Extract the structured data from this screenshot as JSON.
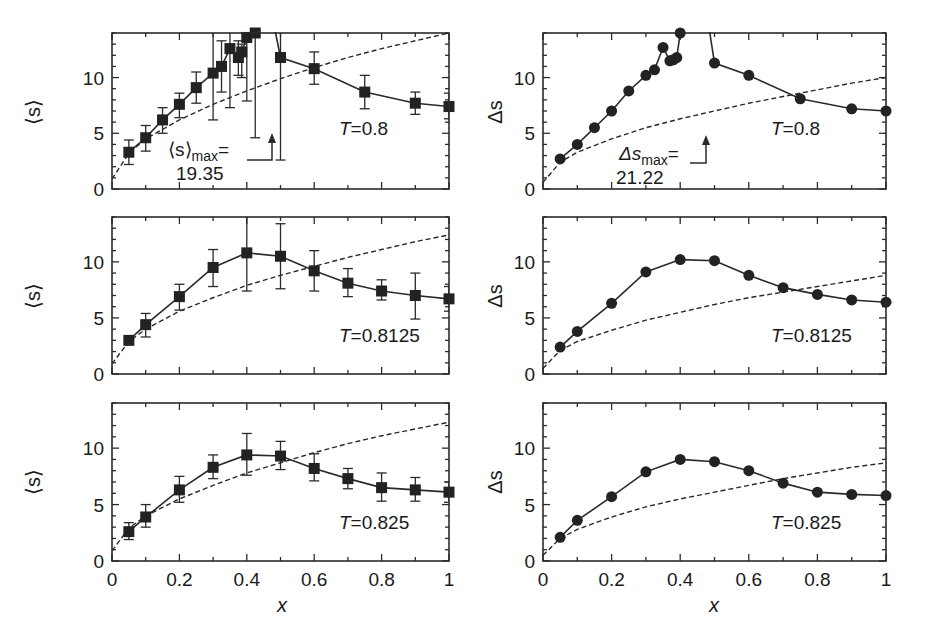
{
  "figure": {
    "x_axis_label": "x",
    "x_tick_labels": [
      "0",
      "0.2",
      "0.4",
      "0.6",
      "0.8",
      "1"
    ],
    "y_tick_labels": [
      "0",
      "5",
      "10"
    ],
    "left_ylabel": "⟨s⟩",
    "right_ylabel": "Δs"
  },
  "annotations": {
    "mean_max_label": "⟨s⟩",
    "mean_max_sub": "max",
    "mean_max_eq": "=",
    "mean_max_value": "19.35",
    "delta_max_label": "Δs",
    "delta_max_sub": "max",
    "delta_max_eq": "=",
    "delta_max_value": "21.22"
  },
  "chart_data": [
    {
      "type": "line",
      "panel": "top-left",
      "title": "T=0.8",
      "xlabel": "",
      "ylabel": "⟨s⟩",
      "xlim": [
        0,
        1
      ],
      "ylim": [
        0,
        14
      ],
      "grid": false,
      "marker": "square",
      "series": [
        {
          "name": "⟨s⟩ data",
          "x": [
            0.05,
            0.1,
            0.15,
            0.2,
            0.25,
            0.3,
            0.325,
            0.35,
            0.375,
            0.385,
            0.4,
            0.425,
            0.45,
            0.5,
            0.6,
            0.75,
            0.9,
            1.0
          ],
          "y": [
            3.3,
            4.6,
            6.2,
            7.6,
            9.1,
            10.4,
            11.0,
            12.6,
            11.8,
            12.3,
            13.6,
            14.0,
            19.35,
            11.8,
            10.8,
            8.7,
            7.7,
            7.4
          ],
          "err_low": [
            2.2,
            3.4,
            5.0,
            6.4,
            7.7,
            6.2,
            8.7,
            7.3,
            10.2,
            10.0,
            7.9,
            4.6,
            14.0,
            2.6,
            9.4,
            7.2,
            6.7,
            6.3
          ],
          "err_high": [
            4.4,
            5.7,
            7.3,
            8.6,
            10.5,
            14.0,
            13.3,
            14.0,
            13.3,
            13.0,
            14.0,
            14.0,
            19.35,
            14.0,
            12.3,
            10.2,
            8.7,
            8.6
          ]
        },
        {
          "name": "fit (dashed)",
          "x": [
            0,
            0.05,
            0.1,
            0.2,
            0.3,
            0.4,
            0.5,
            0.6,
            0.7,
            0.8,
            0.9,
            1.0
          ],
          "y": [
            0.9,
            3.2,
            4.5,
            6.2,
            7.6,
            8.8,
            9.9,
            10.9,
            11.8,
            12.6,
            13.3,
            14.0
          ]
        }
      ],
      "annotation": "⟨s⟩max = 19.35 (off-scale peak, arrow at x≈0.45)"
    },
    {
      "type": "line",
      "panel": "top-right",
      "title": "T=0.8",
      "xlabel": "",
      "ylabel": "Δs",
      "xlim": [
        0,
        1
      ],
      "ylim": [
        0,
        14
      ],
      "grid": false,
      "marker": "circle",
      "series": [
        {
          "name": "Δs data",
          "x": [
            0.05,
            0.1,
            0.15,
            0.2,
            0.25,
            0.3,
            0.325,
            0.35,
            0.37,
            0.38,
            0.39,
            0.4,
            0.45,
            0.5,
            0.6,
            0.75,
            0.9,
            1.0
          ],
          "y": [
            2.7,
            4.0,
            5.5,
            7.0,
            8.8,
            10.2,
            10.7,
            12.7,
            11.5,
            11.6,
            11.8,
            14.0,
            21.22,
            11.3,
            10.2,
            8.1,
            7.2,
            7.0
          ]
        },
        {
          "name": "fit (dashed)",
          "x": [
            0,
            0.05,
            0.1,
            0.2,
            0.3,
            0.4,
            0.5,
            0.6,
            0.7,
            0.8,
            0.9,
            1.0
          ],
          "y": [
            0.6,
            2.4,
            3.3,
            4.5,
            5.5,
            6.3,
            7.0,
            7.7,
            8.3,
            8.9,
            9.5,
            10.0
          ]
        }
      ],
      "annotation": "Δsmax = 21.22 (off-scale peak, arrow at x≈0.45)"
    },
    {
      "type": "line",
      "panel": "middle-left",
      "title": "T=0.8125",
      "xlabel": "",
      "ylabel": "⟨s⟩",
      "xlim": [
        0,
        1
      ],
      "ylim": [
        0,
        14
      ],
      "grid": false,
      "marker": "square",
      "series": [
        {
          "name": "⟨s⟩ data",
          "x": [
            0.05,
            0.1,
            0.2,
            0.3,
            0.4,
            0.5,
            0.6,
            0.7,
            0.8,
            0.9,
            1.0
          ],
          "y": [
            3.0,
            4.4,
            6.9,
            9.5,
            10.8,
            10.5,
            9.2,
            8.1,
            7.4,
            7.0,
            6.7
          ],
          "err_low": [
            2.9,
            3.3,
            5.7,
            7.8,
            7.4,
            7.6,
            7.4,
            6.9,
            6.6,
            4.9,
            5.6
          ],
          "err_high": [
            3.1,
            5.4,
            8.0,
            11.1,
            14.0,
            13.4,
            11.0,
            9.4,
            8.4,
            9.0,
            7.8
          ]
        },
        {
          "name": "fit (dashed)",
          "x": [
            0,
            0.05,
            0.1,
            0.2,
            0.3,
            0.4,
            0.5,
            0.6,
            0.7,
            0.8,
            0.9,
            1.0
          ],
          "y": [
            0.9,
            2.9,
            4.0,
            5.6,
            6.8,
            7.9,
            8.8,
            9.6,
            10.4,
            11.1,
            11.8,
            12.4
          ]
        }
      ]
    },
    {
      "type": "line",
      "panel": "middle-right",
      "title": "T=0.8125",
      "xlabel": "",
      "ylabel": "Δs",
      "xlim": [
        0,
        1
      ],
      "ylim": [
        0,
        14
      ],
      "grid": false,
      "marker": "circle",
      "series": [
        {
          "name": "Δs data",
          "x": [
            0.05,
            0.1,
            0.2,
            0.3,
            0.4,
            0.5,
            0.6,
            0.7,
            0.8,
            0.9,
            1.0
          ],
          "y": [
            2.4,
            3.8,
            6.3,
            9.1,
            10.2,
            10.1,
            8.8,
            7.7,
            7.1,
            6.6,
            6.4
          ]
        },
        {
          "name": "fit (dashed)",
          "x": [
            0,
            0.05,
            0.1,
            0.2,
            0.3,
            0.4,
            0.5,
            0.6,
            0.7,
            0.8,
            0.9,
            1.0
          ],
          "y": [
            0.5,
            2.1,
            2.9,
            3.9,
            4.8,
            5.5,
            6.2,
            6.8,
            7.3,
            7.8,
            8.3,
            8.8
          ]
        }
      ]
    },
    {
      "type": "line",
      "panel": "bottom-left",
      "title": "T=0.825",
      "xlabel": "x",
      "ylabel": "⟨s⟩",
      "xlim": [
        0,
        1
      ],
      "ylim": [
        0,
        14
      ],
      "grid": false,
      "marker": "square",
      "series": [
        {
          "name": "⟨s⟩ data",
          "x": [
            0.05,
            0.1,
            0.2,
            0.3,
            0.4,
            0.5,
            0.6,
            0.7,
            0.8,
            0.9,
            1.0
          ],
          "y": [
            2.6,
            3.9,
            6.3,
            8.3,
            9.4,
            9.3,
            8.2,
            7.3,
            6.5,
            6.3,
            6.1
          ],
          "err_low": [
            1.9,
            3.0,
            5.2,
            7.3,
            7.6,
            8.1,
            7.1,
            6.4,
            5.3,
            5.3,
            5.2
          ],
          "err_high": [
            3.4,
            5.0,
            7.5,
            9.4,
            11.3,
            10.6,
            9.5,
            8.2,
            7.8,
            7.4,
            7.0
          ]
        },
        {
          "name": "fit (dashed)",
          "x": [
            0,
            0.05,
            0.1,
            0.2,
            0.3,
            0.4,
            0.5,
            0.6,
            0.7,
            0.8,
            0.9,
            1.0
          ],
          "y": [
            0.9,
            2.9,
            4.0,
            5.5,
            6.7,
            7.8,
            8.7,
            9.6,
            10.4,
            11.1,
            11.7,
            12.3
          ]
        }
      ]
    },
    {
      "type": "line",
      "panel": "bottom-right",
      "title": "T=0.825",
      "xlabel": "x",
      "ylabel": "Δs",
      "xlim": [
        0,
        1
      ],
      "ylim": [
        0,
        14
      ],
      "grid": false,
      "marker": "circle",
      "series": [
        {
          "name": "Δs data",
          "x": [
            0.05,
            0.1,
            0.2,
            0.3,
            0.4,
            0.5,
            0.6,
            0.7,
            0.8,
            0.9,
            1.0
          ],
          "y": [
            2.1,
            3.6,
            5.7,
            7.9,
            9.0,
            8.8,
            8.0,
            6.9,
            6.1,
            5.9,
            5.8
          ]
        },
        {
          "name": "fit (dashed)",
          "x": [
            0,
            0.05,
            0.1,
            0.2,
            0.3,
            0.4,
            0.5,
            0.6,
            0.7,
            0.8,
            0.9,
            1.0
          ],
          "y": [
            0.5,
            2.0,
            2.8,
            3.9,
            4.8,
            5.5,
            6.1,
            6.7,
            7.3,
            7.8,
            8.3,
            8.7
          ]
        }
      ]
    }
  ]
}
